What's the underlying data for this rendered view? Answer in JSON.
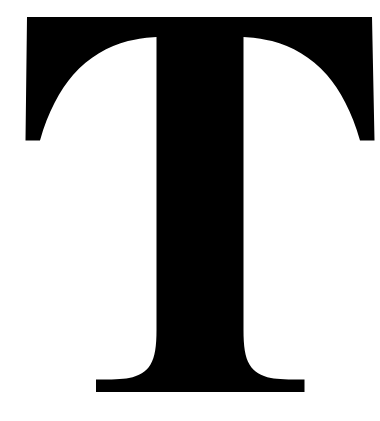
{
  "page": {
    "type": "glyph-image",
    "background_color": "#ffffff",
    "width": 380,
    "height": 421
  },
  "glyph": {
    "character": "T",
    "name": "latin-capital-letter-t",
    "description": "Serif capital letter T",
    "style": "serif",
    "weight": "regular",
    "color": "#000000",
    "background_color": "#ffffff",
    "bounds": {
      "left": 20,
      "top": 17,
      "right": 375,
      "bottom": 392,
      "width": 355,
      "height": 375
    },
    "metrics": {
      "crossbar_top_y": 17,
      "crossbar_left_x": 27,
      "crossbar_right_x": 372,
      "arm_serif_bottom_y": 141,
      "stem_left_x": 157,
      "stem_right_x": 243,
      "stem_width": 83,
      "foot_left_x": 96,
      "foot_right_x": 305,
      "foot_top_y": 379,
      "baseline_y": 392
    },
    "outline_path": "M 27 17 L 372 17 L 374.5 140.5 L 360 140.5 C 352 112 340 90 327 75 C 311 57 292 46 272 41 C 261 38.5 252.5 37.5 243.5 37 L 243.5 330 C 243.5 346 245 357 249.5 364.5 C 254 372 261 376 271 378 C 278 379.2 288 379.6 304.5 379.6 L 304.5 392 L 96 392 L 96 379.6 C 112 379.6 122 379.2 129 378 C 139 376 146 372 150.5 364.5 C 155 357 156.5 346 156.5 330 L 156.5 37 C 147.5 37.5 139 38.5 128 41 C 108 46 89 57 73 75 C 60 90 48 112 40 140.5 L 25.5 140.5 Z"
  }
}
